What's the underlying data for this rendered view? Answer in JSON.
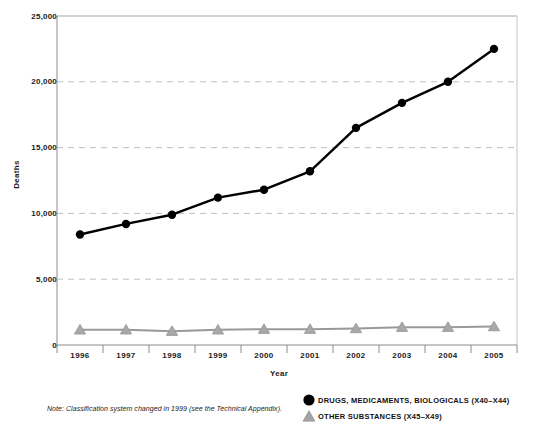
{
  "chart_data": {
    "type": "line",
    "title": "",
    "xlabel": "Year",
    "ylabel": "Deaths",
    "categories": [
      "1996",
      "1997",
      "1998",
      "1999",
      "2000",
      "2001",
      "2002",
      "2003",
      "2004",
      "2005"
    ],
    "ylim": [
      0,
      25000
    ],
    "yticks": [
      0,
      5000,
      10000,
      15000,
      20000,
      25000
    ],
    "ytick_labels": [
      "0",
      "5,000",
      "10,000",
      "15,000",
      "20,000",
      "25,000"
    ],
    "grid": "horizontal-dashed",
    "legend_position": "bottom-right",
    "note": "Note: Classification system changed in 1999 (see the Technical Appendix).",
    "series": [
      {
        "name": "DRUGS, MEDICAMENTS, BIOLOGICALS (X40–X44)",
        "marker": "circle",
        "color": "#000000",
        "values": [
          8400,
          9200,
          9900,
          11200,
          11800,
          13200,
          16500,
          18400,
          20000,
          22500
        ]
      },
      {
        "name": "OTHER SUBSTANCES (X45–X49)",
        "marker": "triangle",
        "color": "#999999",
        "values": [
          1150,
          1150,
          1050,
          1150,
          1200,
          1200,
          1250,
          1350,
          1350,
          1400
        ]
      }
    ]
  },
  "axes": {
    "y_title": "Deaths",
    "x_title": "Year",
    "y_tick_labels": [
      "25,000",
      "20,000",
      "15,000",
      "10,000",
      "5,000",
      "0"
    ],
    "x_tick_labels": [
      "1996",
      "1997",
      "1998",
      "1999",
      "2000",
      "2001",
      "2002",
      "2003",
      "2004",
      "2005"
    ]
  },
  "legend": {
    "items": [
      {
        "label": "DRUGS, MEDICAMENTS, BIOLOGICALS (X40–X44)",
        "marker": "circle",
        "color": "#000000"
      },
      {
        "label": "OTHER SUBSTANCES (X45–X49)",
        "marker": "triangle",
        "color": "#999999"
      }
    ]
  },
  "note": {
    "text": "Note: Classification system changed in 1999 (see the Technical Appendix)."
  },
  "colors": {
    "series_primary": "#000000",
    "series_secondary": "#999999",
    "gridline": "#bfbfbf",
    "axis": "#8c8c8c",
    "background": "#ffffff"
  }
}
